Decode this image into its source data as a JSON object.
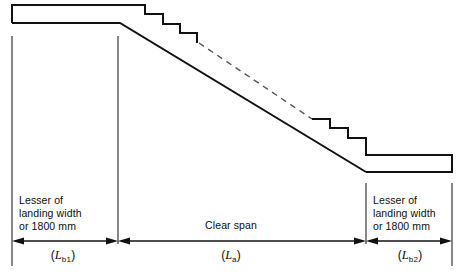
{
  "figure": {
    "stroke_color": "#111111",
    "background_color": "#ffffff"
  },
  "annotations": {
    "left_note": {
      "line1": "Lesser of",
      "line2": "landing width",
      "line3": "or 1800 mm"
    },
    "right_note": {
      "line1": "Lesser of",
      "line2": "landing width",
      "line3": "or 1800 mm"
    },
    "center_label": "Clear span"
  },
  "symbols": {
    "left": {
      "open": "(",
      "letter": "L",
      "sub": "b1",
      "close": ")"
    },
    "center": {
      "open": "(",
      "letter": "L",
      "sub": "a",
      "close": ")"
    },
    "right": {
      "open": "(",
      "letter": "L",
      "sub": "b2",
      "close": ")"
    }
  },
  "geometry": {
    "top_landing": {
      "x1": 12,
      "x2": 145,
      "y_top": 5,
      "y_bottom": 23
    },
    "bottom_landing": {
      "x1": 366,
      "x2": 452,
      "y_top": 155,
      "y_bottom": 172
    },
    "dimension_line_y": 241,
    "extension_lines_x": [
      12,
      118,
      366,
      452
    ]
  }
}
